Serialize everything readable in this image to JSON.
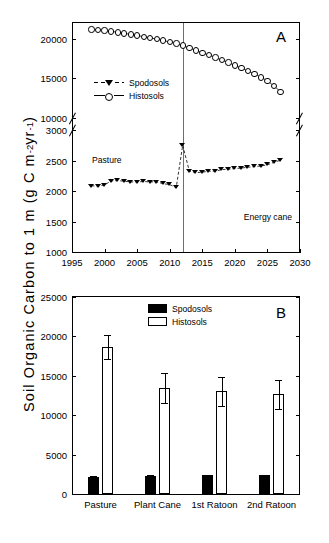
{
  "figure": {
    "ylabel_text": "Soil Organic Carbon to 1 m (g C m",
    "ylabel_exp1": "-2",
    "ylabel_mid": " yr",
    "ylabel_exp2": "-1",
    "ylabel_end": ")",
    "ylabel_full": "Soil Organic Carbon to 1 m (g C m-2 yr-1)"
  },
  "legend": {
    "spodosols": "Spodosols",
    "histosols": "Histosols"
  },
  "panelA": {
    "label": "A",
    "annotation_left": "Pasture",
    "annotation_right": "Energy cane",
    "transition_year": 2012
  },
  "panelB": {
    "label": "B"
  },
  "chart_data": [
    {
      "type": "line",
      "panel": "A",
      "title": "A",
      "xlabel": "",
      "ylabel": "Soil Organic Carbon to 1 m (g C m-2 yr-1)",
      "xlim": [
        1995,
        2030
      ],
      "xticks": [
        1995,
        2000,
        2005,
        2010,
        2015,
        2020,
        2025,
        2030
      ],
      "broken_axis": true,
      "yaxis_lower_segment": {
        "ylim": [
          1000,
          3000
        ],
        "yticks": [
          1000,
          1500,
          2000,
          2500,
          3000
        ]
      },
      "yaxis_upper_segment": {
        "ylim": [
          10000,
          22000
        ],
        "yticks": [
          10000,
          15000,
          20000
        ]
      },
      "grid": false,
      "legend_position": "upper-left-inside",
      "annotations": [
        {
          "text": "Pasture",
          "x": 1999,
          "note": "left of transition line"
        },
        {
          "text": "Energy cane",
          "x": 2024,
          "note": "right of transition line"
        },
        {
          "text": "A",
          "x": 2028,
          "note": "panel label, top right"
        }
      ],
      "vertical_divider_x": 2012,
      "x": [
        1998,
        1999,
        2000,
        2001,
        2002,
        2003,
        2004,
        2005,
        2006,
        2007,
        2008,
        2009,
        2010,
        2011,
        2012,
        2013,
        2014,
        2015,
        2016,
        2017,
        2018,
        2019,
        2020,
        2021,
        2022,
        2023,
        2024,
        2025,
        2026,
        2027
      ],
      "series": [
        {
          "name": "Spodosols",
          "marker": "filled-triangle-down",
          "linestyle": "dashed",
          "axis_segment": "lower",
          "values": [
            2085,
            2080,
            2100,
            2165,
            2170,
            2160,
            2150,
            2150,
            2155,
            2150,
            2150,
            2120,
            2105,
            2055,
            2750,
            2330,
            2300,
            2310,
            2325,
            2325,
            2350,
            2355,
            2370,
            2375,
            2390,
            2400,
            2410,
            2430,
            2470,
            2505
          ]
        },
        {
          "name": "Histosols",
          "marker": "open-circle",
          "linestyle": "solid",
          "axis_segment": "upper",
          "values": [
            21200,
            21150,
            21050,
            20950,
            20820,
            20700,
            20560,
            20420,
            20280,
            20130,
            19960,
            19790,
            19600,
            19400,
            19150,
            18850,
            18550,
            18250,
            17950,
            17650,
            17330,
            17000,
            16650,
            16300,
            15930,
            15550,
            15150,
            14700,
            14050,
            13320
          ]
        }
      ]
    },
    {
      "type": "bar",
      "panel": "B",
      "title": "B",
      "xlabel": "",
      "ylabel": "Soil Organic Carbon to 1 m (g C m-2 yr-1)",
      "ylim": [
        0,
        25000
      ],
      "yticks": [
        0,
        5000,
        10000,
        15000,
        20000,
        25000
      ],
      "grid": false,
      "legend_position": "upper-center",
      "categories": [
        "Pasture",
        "Plant Cane",
        "1st Ratoon",
        "2nd Ratoon"
      ],
      "series": [
        {
          "name": "Spodosols",
          "fill": "solid-black",
          "values": [
            2150,
            2330,
            2350,
            2370
          ],
          "errors": [
            120,
            90,
            90,
            90
          ]
        },
        {
          "name": "Histosols",
          "fill": "open-white",
          "values": [
            18650,
            13450,
            13050,
            12650
          ],
          "errors": [
            1500,
            1950,
            1850,
            1850
          ]
        }
      ]
    }
  ]
}
